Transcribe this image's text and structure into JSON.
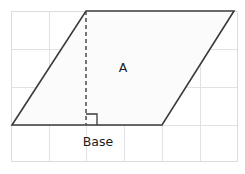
{
  "figure": {
    "kind": "parallelogram-area-diagram",
    "canvas": {
      "width": 245,
      "height": 174,
      "background": "#ffffff"
    },
    "colors": {
      "grid_line": "#e2e2e6",
      "grid_border": "#dcdce0",
      "shape_stroke": "#3a3a3a",
      "shape_fill": "#fbfbfc",
      "height_line": "#4a4a4a",
      "label_text": "#1a1a1a"
    },
    "grid": {
      "left": 11,
      "top": 11,
      "right": 238,
      "bottom": 162,
      "vertical_lines": [
        49,
        86,
        124,
        162,
        200
      ],
      "horizontal_lines": [
        49,
        87,
        125
      ]
    },
    "parallelogram": {
      "vertices": [
        {
          "name": "bottom-left",
          "x": 12,
          "y": 125
        },
        {
          "name": "top-left",
          "x": 86,
          "y": 11
        },
        {
          "name": "top-right",
          "x": 234,
          "y": 11
        },
        {
          "name": "bottom-right",
          "x": 162,
          "y": 125
        }
      ],
      "points_attr": "12,125 86,11 234,11 162,125"
    },
    "height_line": {
      "from_x": 86,
      "from_y": 11,
      "to_x": 86,
      "to_y": 125,
      "style": "dashed"
    },
    "right_angle_marker": {
      "x": 86,
      "y": 114,
      "size": 11,
      "points_attr": "86,114 97,114 97,125"
    },
    "labels": {
      "area": {
        "text": "A",
        "x": 123,
        "y": 72
      },
      "base": {
        "text": "Base",
        "x": 98,
        "y": 146
      }
    }
  }
}
